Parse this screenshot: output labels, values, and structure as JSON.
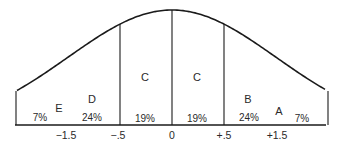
{
  "chart_data": {
    "type": "area",
    "title": "",
    "xlabel": "",
    "ylabel": "",
    "distribution": "normal",
    "x_ticks": [
      "-1.5",
      "-.5",
      "0",
      "+.5",
      "+1.5"
    ],
    "x_tick_labels": [
      "−1.5",
      "−.5",
      "0",
      "+.5",
      "+1.5"
    ],
    "regions": [
      {
        "grade": "E",
        "from": null,
        "to": -1.5,
        "percent": 7,
        "percent_label": "7%"
      },
      {
        "grade": "D",
        "from": -1.5,
        "to": -0.5,
        "percent": 24,
        "percent_label": "24%"
      },
      {
        "grade": "C",
        "from": -0.5,
        "to": 0,
        "percent": 19,
        "percent_label": "19%"
      },
      {
        "grade": "C",
        "from": 0,
        "to": 0.5,
        "percent": 19,
        "percent_label": "19%"
      },
      {
        "grade": "B",
        "from": 0.5,
        "to": 1.5,
        "percent": 24,
        "percent_label": "24%"
      },
      {
        "grade": "A",
        "from": 1.5,
        "to": null,
        "percent": 7,
        "percent_label": "7%"
      }
    ],
    "grid": false,
    "legend": "none"
  },
  "colors": {
    "line": "#1a1a1a",
    "text": "#2a2a2a",
    "background": "#ffffff"
  }
}
